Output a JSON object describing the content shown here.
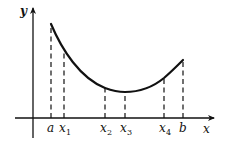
{
  "diagram": {
    "title": "",
    "axes": {
      "x_label": "x",
      "y_label": "y",
      "origin_px": [
        33,
        118
      ],
      "x_axis": {
        "from": 15,
        "to": 214,
        "y": 118
      },
      "y_axis": {
        "x": 33,
        "from": 138,
        "to": 7
      }
    },
    "curve": {
      "description": "convex curve decreasing from a to minimum near x3 then increasing to b",
      "path": "M51,24 C62,50 80,78 105,88 C113,91 119,92 125,92 C140,92 153,87 164,78 C171,72 177,66 183,60",
      "color": "#111111"
    },
    "points": [
      {
        "name": "a",
        "label": "a",
        "subscript": "",
        "x": 51,
        "curve_y": 24
      },
      {
        "name": "x1",
        "label": "x",
        "subscript": "1",
        "x": 64,
        "curve_y": 52
      },
      {
        "name": "x2",
        "label": "x",
        "subscript": "2",
        "x": 105,
        "curve_y": 88
      },
      {
        "name": "x3",
        "label": "x",
        "subscript": "3",
        "x": 125,
        "curve_y": 92
      },
      {
        "name": "x4",
        "label": "x",
        "subscript": "4",
        "x": 164,
        "curve_y": 78
      },
      {
        "name": "b",
        "label": "b",
        "subscript": "",
        "x": 183,
        "curve_y": 60
      }
    ],
    "colors": {
      "line": "#111111",
      "background": "#ffffff"
    }
  }
}
